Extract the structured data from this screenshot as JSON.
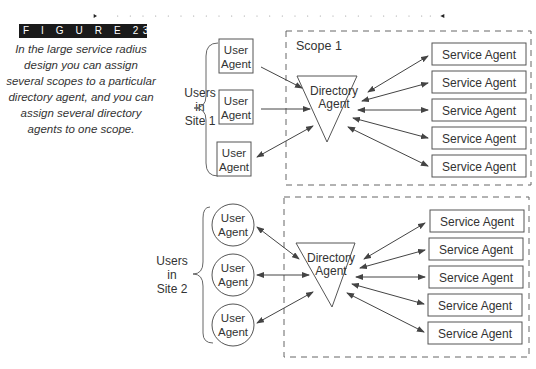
{
  "figure": {
    "label": "F I G U R E   23.26",
    "caption": "In the large service radius design you can assign several scopes to a particular directory agent, and you can assign several directory agents to one scope."
  },
  "site1": {
    "group_label": [
      "Users",
      "in",
      "Site 1"
    ],
    "scope_label": "Scope 1",
    "user_agents": [
      {
        "line1": "User",
        "line2": "Agent"
      },
      {
        "line1": "User",
        "line2": "Agent"
      },
      {
        "line1": "User",
        "line2": "Agent"
      }
    ],
    "directory_agent": {
      "line1": "Directory",
      "line2": "Agent"
    },
    "service_agents": [
      "Service Agent",
      "Service Agent",
      "Service Agent",
      "Service Agent",
      "Service Agent"
    ]
  },
  "site2": {
    "group_label": [
      "Users",
      "in",
      "Site 2"
    ],
    "user_agents": [
      {
        "line1": "User",
        "line2": "Agent"
      },
      {
        "line1": "User",
        "line2": "Agent"
      },
      {
        "line1": "User",
        "line2": "Agent"
      }
    ],
    "directory_agent": {
      "line1": "Directory",
      "line2": "Agent"
    },
    "service_agents": [
      "Service Agent",
      "Service Agent",
      "Service Agent",
      "Service Agent",
      "Service Agent"
    ]
  },
  "colors": {
    "stroke": "#555555",
    "text": "#333333",
    "label_bg": "#1a1a1a"
  }
}
